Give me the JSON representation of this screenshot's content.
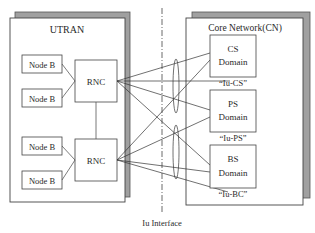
{
  "diagram": {
    "utran": {
      "title": "UTRAN",
      "node_b": [
        "Node B",
        "Node B",
        "Node B",
        "Node B"
      ],
      "rnc": [
        "RNC",
        "RNC"
      ]
    },
    "core_network": {
      "title": "Core Network(CN)",
      "domains": [
        {
          "line1": "CS",
          "line2": "Domain",
          "iu_label": "“Iu-CS”"
        },
        {
          "line1": "PS",
          "line2": "Domain",
          "iu_label": "“Iu-PS”"
        },
        {
          "line1": "BS",
          "line2": "Domain",
          "iu_label": "“Iu-BC”"
        }
      ]
    },
    "interface_label": "Iu Interface",
    "colors": {
      "stroke": "#3a3a3a",
      "shadow": "#9a9a9a",
      "background": "#ffffff"
    }
  }
}
